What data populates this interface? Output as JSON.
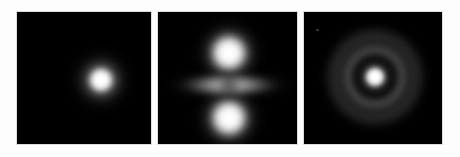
{
  "figure": {
    "background_color": "#fdfdfd",
    "panel_background_color": "#000000",
    "panel_border_color": "#dcdcdc",
    "colormap": "grayscale",
    "panel_count": 3,
    "layout": "1 row x 3 columns"
  },
  "panels": [
    {
      "id": "panel-1",
      "caption": "",
      "pattern": "single-compact-spherical-blob",
      "description": "One bright circular intensity maximum near the centre of a black field, no nodes.",
      "bounds": {
        "x": 16,
        "y": 11,
        "width": 136,
        "height": 134
      },
      "features": [
        {
          "name": "central-blob",
          "center_x": 84,
          "center_y": 79,
          "core_diameter": 26,
          "halo_diameter": 74,
          "peak_brightness": 255
        }
      ]
    },
    {
      "id": "panel-2",
      "caption": "",
      "pattern": "two-vertical-lobes-with-equatorial-band",
      "description": "Two bright lobes above and below centre plus a dimmer horizontal band pinched at the middle.",
      "bounds": {
        "x": 157,
        "y": 11,
        "width": 141,
        "height": 134
      },
      "features": [
        {
          "name": "top-lobe",
          "center_x": 228,
          "center_y": 52,
          "core_diameter": 40,
          "halo_diameter": 78,
          "peak_brightness": 255
        },
        {
          "name": "bottom-lobe",
          "center_x": 228,
          "center_y": 117,
          "core_diameter": 40,
          "halo_diameter": 78,
          "peak_brightness": 255
        },
        {
          "name": "equatorial-band",
          "center_x": 228,
          "center_y": 84,
          "width": 128,
          "height": 30,
          "peak_brightness": 175
        },
        {
          "name": "central-waist-node",
          "center_x": 228,
          "center_y": 84,
          "diameter": 26,
          "peak_brightness": 30
        }
      ]
    },
    {
      "id": "panel-3",
      "caption": "",
      "pattern": "concentric-rings-radial-nodes",
      "description": "Bright central core surrounded by a dark node ring, a grey annulus and a fainter outer halo ring.",
      "bounds": {
        "x": 303,
        "y": 11,
        "width": 140,
        "height": 134
      },
      "features": [
        {
          "name": "central-core",
          "center_x": 374,
          "center_y": 76,
          "core_diameter": 20,
          "halo_diameter": 40,
          "peak_brightness": 255
        },
        {
          "name": "inner-dark-node",
          "center_x": 374,
          "center_y": 76,
          "diameter": 44,
          "peak_brightness": 10
        },
        {
          "name": "middle-ring",
          "center_x": 374,
          "center_y": 76,
          "diameter": 74,
          "peak_brightness": 128
        },
        {
          "name": "outer-ring",
          "center_x": 374,
          "center_y": 76,
          "diameter": 112,
          "peak_brightness": 92
        },
        {
          "name": "upper-left-speck",
          "center_x": 315,
          "center_y": 28,
          "diameter": 3,
          "peak_brightness": 118
        }
      ]
    }
  ],
  "chart_data": {
    "type": "heatmap",
    "title": "",
    "subtitle": "",
    "xlabel": "",
    "ylabel": "",
    "grid": false,
    "legend": "none",
    "colormap": "grayscale",
    "value_range": [
      0,
      255
    ],
    "panel_titles": [
      "",
      "",
      ""
    ],
    "series": [
      {
        "name": "panel-1",
        "structure": "single spherical maximum",
        "radial_profile_brightness": [
          255,
          250,
          225,
          165,
          95,
          40,
          12,
          0
        ],
        "radial_profile_radius_px": [
          0,
          5,
          9,
          14,
          20,
          27,
          33,
          40
        ]
      },
      {
        "name": "panel-2",
        "structure": "two axial lobes plus equatorial band",
        "vertical_profile_brightness": [
          0,
          45,
          170,
          255,
          180,
          70,
          150,
          175,
          150,
          70,
          180,
          255,
          170,
          45,
          0
        ],
        "vertical_profile_y_px": [
          11,
          22,
          35,
          52,
          64,
          72,
          78,
          84,
          90,
          96,
          104,
          117,
          131,
          140,
          145
        ],
        "horizontal_band_profile_brightness": [
          0,
          60,
          140,
          175,
          165,
          60,
          165,
          175,
          140,
          60,
          0
        ],
        "horizontal_band_profile_x_px": [
          160,
          172,
          186,
          200,
          214,
          228,
          242,
          256,
          270,
          284,
          296
        ]
      },
      {
        "name": "panel-3",
        "structure": "concentric radial nodes",
        "radial_profile_brightness": [
          255,
          245,
          150,
          40,
          10,
          85,
          128,
          95,
          45,
          70,
          92,
          60,
          20,
          0
        ],
        "radial_profile_radius_px": [
          0,
          5,
          9,
          14,
          20,
          26,
          33,
          40,
          46,
          50,
          56,
          62,
          66,
          70
        ]
      }
    ]
  }
}
